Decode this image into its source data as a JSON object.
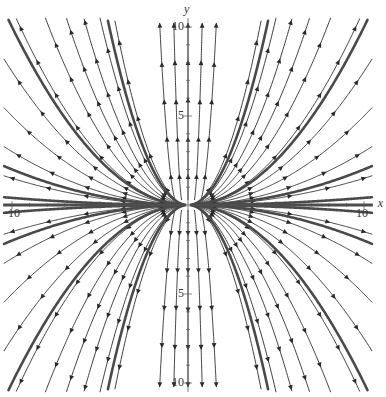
{
  "diagram": {
    "type": "phase_portrait",
    "title": "",
    "system": {
      "dx": "x",
      "dy": "2*y"
    },
    "equilibrium": {
      "x": 0,
      "y": 0,
      "kind": "unstable node (source)"
    },
    "axes": {
      "x_label": "x",
      "y_label": "y",
      "x_range": [
        -10.5,
        10.5
      ],
      "y_range": [
        -10.5,
        10.5
      ],
      "x_ticks": [
        {
          "value": -10,
          "label": "-10"
        },
        {
          "value": 10,
          "label": "10"
        }
      ],
      "y_ticks": [
        {
          "value": 10,
          "label": "10"
        },
        {
          "value": 5,
          "label": "5"
        },
        {
          "value": -5,
          "label": "5"
        },
        {
          "value": -10,
          "label": "10"
        }
      ]
    },
    "pixel_frame": {
      "origin_x": 188,
      "origin_y": 205,
      "px_per_unit_x": 17.6,
      "px_per_unit_y": 17.8
    },
    "colors": {
      "stream": "#2a2a2a",
      "thick_trajectory": "#4a4a4a",
      "axis": "#555555",
      "background": "#ffffff"
    },
    "stream_coefficients": [
      -0.6,
      -0.42,
      -0.3,
      -0.22,
      -0.16,
      -0.11,
      -0.075,
      -0.05,
      -0.03,
      -0.015,
      0.015,
      0.03,
      0.05,
      0.075,
      0.11,
      0.16,
      0.22,
      0.3,
      0.42,
      0.6
    ],
    "vertical_streams_x": [
      -1.6,
      -0.8,
      0,
      0.8,
      1.6
    ],
    "thick_trajectories": [
      {
        "c": 0.1,
        "label": "y = 0.1 x^2"
      },
      {
        "c": -0.1,
        "label": "y = -0.1 x^2"
      },
      {
        "c": 0.5,
        "label": "y = 0.5 x^2"
      },
      {
        "c": -0.5,
        "label": "y = -0.5 x^2"
      },
      {
        "c": 0.02,
        "label": "y = 0.02 x^2"
      },
      {
        "c": -0.02,
        "label": "y = -0.02 x^2"
      },
      {
        "c": 0.004,
        "label": "y = 0.004 x^2"
      },
      {
        "c": -0.004,
        "label": "y = -0.004 x^2"
      }
    ]
  }
}
